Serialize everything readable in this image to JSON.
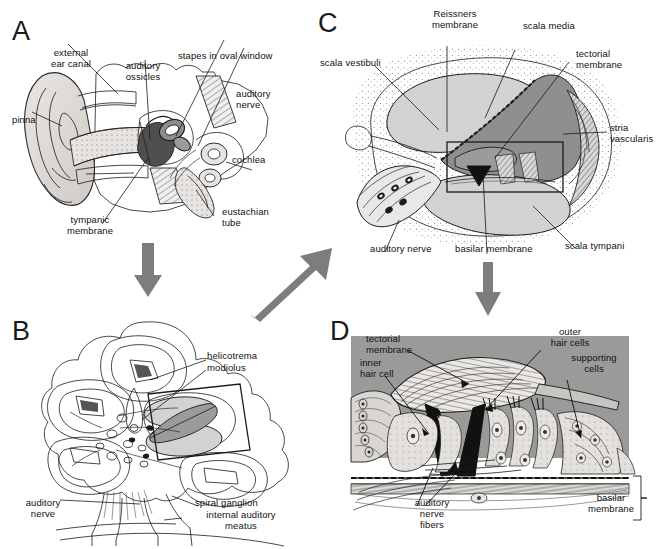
{
  "figure": {
    "background_color": "#ffffff",
    "arrow_color": "#7d7d7d",
    "line_color": "#1a1a1a",
    "width": 659,
    "height": 549
  },
  "panels": [
    {
      "id": "A",
      "letter": "A",
      "caption": "Outer, middle and inner ear overview",
      "labels": [
        {
          "key": "external_ear_canal",
          "text": "external\near canal"
        },
        {
          "key": "auditory_ossicles",
          "text": "auditory\nossicles"
        },
        {
          "key": "stapes_in_oval_window",
          "text": "stapes in oval window"
        },
        {
          "key": "auditory_nerve",
          "text": "auditory\nnerve"
        },
        {
          "key": "pinna",
          "text": "pinna"
        },
        {
          "key": "cochlea",
          "text": "cochlea"
        },
        {
          "key": "tympanic_membrane",
          "text": "tympanic\nmembrane"
        },
        {
          "key": "eustachian_tube",
          "text": "eustachian\ntube"
        }
      ]
    },
    {
      "id": "B",
      "letter": "B",
      "caption": "Cross section through the cochlear spiral",
      "labels": [
        {
          "key": "helicotrema",
          "text": "helicotrema"
        },
        {
          "key": "modiolus",
          "text": "modiolus"
        },
        {
          "key": "auditory_nerve",
          "text": "auditory\nnerve"
        },
        {
          "key": "spiral_ganglion",
          "text": "spiral ganglion"
        },
        {
          "key": "internal_auditory_meatus",
          "text": "internal auditory\nmeatus"
        }
      ]
    },
    {
      "id": "C",
      "letter": "C",
      "caption": "Cross section of one cochlear turn",
      "labels": [
        {
          "key": "reissners_membrane",
          "text": "Reissners\nmembrane"
        },
        {
          "key": "scala_media",
          "text": "scala media"
        },
        {
          "key": "tectorial_membrane",
          "text": "tectorial\nmembrane"
        },
        {
          "key": "scala_vestibuli",
          "text": "scala vestibuli"
        },
        {
          "key": "stria_vascularis",
          "text": "stria\nvascularis"
        },
        {
          "key": "auditory_nerve",
          "text": "auditory nerve"
        },
        {
          "key": "basilar_membrane",
          "text": "basilar membrane"
        },
        {
          "key": "scala_tympani",
          "text": "scala tympani"
        }
      ]
    },
    {
      "id": "D",
      "letter": "D",
      "caption": "Organ of Corti detail",
      "labels": [
        {
          "key": "tectorial_membrane",
          "text": "tectorial\nmembrane"
        },
        {
          "key": "inner_hair_cell",
          "text": "inner\nhair cell"
        },
        {
          "key": "outer_hair_cells",
          "text": "outer\nhair cells"
        },
        {
          "key": "supporting_cells",
          "text": "supporting\ncells"
        },
        {
          "key": "auditory_nerve_fibers",
          "text": "auditory\nnerve\nfibers"
        },
        {
          "key": "basilar_membrane",
          "text": "basilar\nmembrane"
        }
      ]
    }
  ],
  "arrows": [
    {
      "key": "a_to_b",
      "from": "A",
      "to": "B",
      "direction": "down"
    },
    {
      "key": "b_to_c",
      "from": "B",
      "to": "C",
      "direction": "up-right"
    },
    {
      "key": "c_to_d",
      "from": "C",
      "to": "D",
      "direction": "down"
    }
  ],
  "colors": {
    "fill_light": "#d2d2d2",
    "fill_mid": "#a3a3a3",
    "fill_dark": "#8f8f8f",
    "panel_d_bg": "#9a9a9a",
    "ink": "#1a1a1a",
    "stipple": "#bdbdbd"
  }
}
